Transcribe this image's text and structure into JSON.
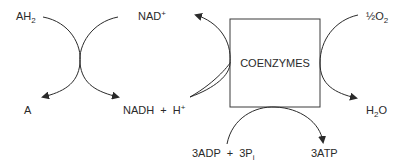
{
  "diagram": {
    "box": {
      "label": "COENZYMES"
    },
    "left_pair": {
      "reactant_1": {
        "main": "AH",
        "sub": "2"
      },
      "product_1": "A",
      "reactant_2": {
        "main": "NAD",
        "sup": "+"
      },
      "product_2": {
        "main": "NADH  +  H",
        "sup": "+"
      }
    },
    "right_pair": {
      "reactant": {
        "main": "½O",
        "sub": "2"
      },
      "product": {
        "main": "H",
        "sub": "2",
        "tail": "O"
      }
    },
    "bottom_pair": {
      "reactant": {
        "main": "3ADP  +  3P",
        "sub": "i"
      },
      "product": "3ATP"
    },
    "colors": {
      "line": "#2a2a2a",
      "text": "#2a2a2a",
      "background": "#ffffff"
    }
  }
}
